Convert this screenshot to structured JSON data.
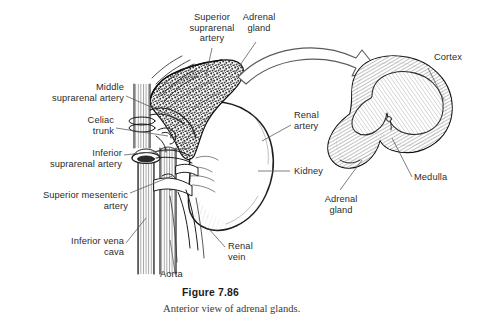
{
  "figure": {
    "number": "Figure 7.86",
    "caption": "Anterior view of adrenal glands.",
    "background_color": "#ffffff",
    "label_color": "#2b2b2b",
    "line_color": "#555555",
    "ink_color": "#1b1b1b"
  },
  "labels": {
    "superior_suprarenal_artery": "Superior\nsuprarenal\nartery",
    "adrenal_gland_top": "Adrenal\ngland",
    "middle_suprarenal_artery": "Middle\nsuprarenal artery",
    "celiac_trunk": "Celiac\ntrunk",
    "inferior_suprarenal_artery": "Inferior\nsuprarenal artery",
    "superior_mesenteric_artery": "Superior mesenteric\nartery",
    "inferior_vena_cava": "Inferior vena\ncava",
    "aorta": "Aorta",
    "renal_vein": "Renal\nvein",
    "renal_artery": "Renal\nartery",
    "kidney": "Kidney",
    "cortex": "Cortex",
    "medulla": "Medulla",
    "adrenal_gland_section": "Adrenal\ngland"
  },
  "structures": {
    "left_panel": "anterior view of kidney, adrenal gland, aorta and inferior vena cava with suprarenal arteries",
    "right_panel": "cross-section of adrenal gland showing cortex and medulla",
    "transition_arrow": "curved-arrow-icon"
  }
}
